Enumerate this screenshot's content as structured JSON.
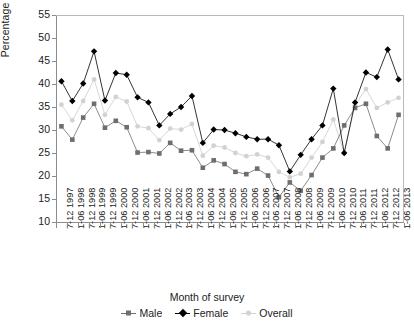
{
  "chart_data": {
    "type": "line",
    "title": "",
    "xlabel": "Month of survey",
    "ylabel": "Percentage",
    "ylim": [
      10,
      55
    ],
    "yticks": [
      10,
      15,
      20,
      25,
      30,
      35,
      40,
      45,
      50,
      55
    ],
    "grid": false,
    "legend_position": "bottom",
    "categories": [
      "7-12 1997",
      "1-06 1998",
      "7-12 1998",
      "1-06 1999",
      "7-12 1999",
      "1-06 2000",
      "7-12 2000",
      "1-06 2001",
      "7-12 2001",
      "1-06 2002",
      "7-12 2002",
      "1-06 2003",
      "7-12 2003",
      "1-06 2004",
      "7-12 2004",
      "1-06 2005",
      "7-12 2005",
      "1-06 2006",
      "7-12 2006",
      "1-06 2007",
      "7-12 2007",
      "1-06 2008",
      "7-12 2008",
      "1-06 2009",
      "7-12 2009",
      "1-06 2010",
      "7-12 2010",
      "1-06 2011",
      "7-12 2011",
      "1-06 2012",
      "7-12 2012",
      "1-06 2013"
    ],
    "series": [
      {
        "name": "Male",
        "color": "#6e6e6e",
        "marker": "square",
        "values": [
          30.8,
          27.9,
          32.7,
          35.7,
          30.5,
          32.0,
          30.6,
          25.1,
          25.2,
          24.9,
          27.2,
          25.5,
          25.6,
          21.8,
          23.4,
          22.6,
          20.9,
          20.4,
          21.6,
          20.1,
          15.4,
          18.6,
          16.8,
          20.2,
          24.0,
          26.0,
          31.0,
          34.8,
          35.7,
          28.7,
          26.0,
          33.3
        ]
      },
      {
        "name": "Female",
        "color": "#000000",
        "marker": "diamond",
        "values": [
          40.6,
          36.3,
          40.1,
          47.1,
          36.4,
          42.4,
          42.0,
          37.1,
          36.0,
          31.0,
          33.5,
          35.0,
          37.4,
          27.2,
          30.1,
          30.0,
          29.3,
          28.5,
          28.0,
          28.0,
          26.7,
          21.0,
          24.6,
          28.0,
          31.0,
          39.0,
          25.0,
          36.0,
          42.5,
          41.5,
          47.5,
          41.0
        ]
      },
      {
        "name": "Overall",
        "color": "#d2d2d2",
        "marker": "circle",
        "values": [
          35.5,
          32.1,
          36.3,
          41.0,
          33.3,
          37.2,
          36.2,
          30.8,
          30.4,
          27.8,
          30.3,
          30.1,
          31.3,
          24.4,
          26.6,
          26.2,
          25.0,
          24.3,
          24.7,
          24.0,
          20.9,
          19.7,
          20.5,
          24.0,
          27.4,
          32.3,
          25.0,
          35.4,
          38.9,
          34.8,
          36.0,
          37.0
        ]
      }
    ]
  },
  "legend": {
    "items": [
      {
        "label": "Male"
      },
      {
        "label": "Female"
      },
      {
        "label": "Overall"
      }
    ]
  }
}
